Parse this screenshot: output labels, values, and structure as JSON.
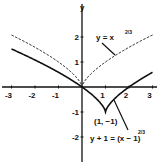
{
  "chart_data": {
    "type": "line",
    "title": "",
    "xlabel": "",
    "ylabel": "y",
    "xlim": [
      -3,
      3
    ],
    "ylim": [
      -2.7,
      3.3
    ],
    "grid": false,
    "x_ticks": [
      "-3",
      "-2",
      "-1",
      "1",
      "2",
      "3"
    ],
    "x_tick_values": [
      -3,
      -2,
      -1,
      1,
      2,
      3
    ],
    "y_ticks": [
      "2",
      "1",
      "-1",
      "-2"
    ],
    "y_tick_values": [
      2,
      1,
      -1,
      -2
    ],
    "series": [
      {
        "name": "y = x^(2/3)",
        "style": "dashed",
        "label_main": "y = x",
        "label_exp": "2/3",
        "formula": "x^(2/3)",
        "shift_x": 0,
        "shift_y": 0,
        "x_range": [
          -3,
          3
        ]
      },
      {
        "name": "y + 1 = (x - 1)^(2/3)",
        "style": "solid",
        "label_main": "y + 1 = (x − 1)",
        "label_exp": "2/3",
        "formula": "(x-1)^(2/3) - 1",
        "shift_x": 1,
        "shift_y": -1,
        "x_range": [
          -3,
          3
        ]
      }
    ],
    "annotations": [
      {
        "text": "(1, −1)",
        "x": 1,
        "y": -1
      }
    ],
    "colors": {
      "line": "#111111",
      "background": "#ffffff"
    }
  }
}
